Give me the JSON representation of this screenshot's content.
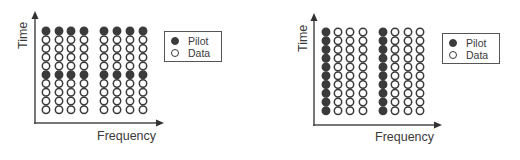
{
  "colors": {
    "pilot_fill": "#3b3b3b",
    "data_fill": "#ffffff",
    "stroke": "#3b3b3b",
    "axis": "#4a4a4a"
  },
  "legend": {
    "pilot_label": "Pilot",
    "data_label": "Data"
  },
  "diagrams": [
    {
      "id": "block-type-pilot",
      "x_axis_label": "Frequency",
      "y_axis_label": "Time",
      "rows": 10,
      "cols": 8,
      "column_groups": [
        [
          0,
          1,
          2,
          3
        ],
        [
          4,
          5,
          6,
          7
        ]
      ],
      "pilot_pattern": "rows",
      "pilot_rows": [
        0,
        5
      ],
      "pilot_cols": []
    },
    {
      "id": "comb-type-pilot",
      "x_axis_label": "Frequency",
      "y_axis_label": "Time",
      "rows": 10,
      "cols": 8,
      "column_groups": [
        [
          0,
          1,
          2,
          3
        ],
        [
          4,
          5,
          6,
          7
        ]
      ],
      "pilot_pattern": "columns",
      "pilot_rows": [],
      "pilot_cols": [
        0,
        4
      ]
    }
  ]
}
